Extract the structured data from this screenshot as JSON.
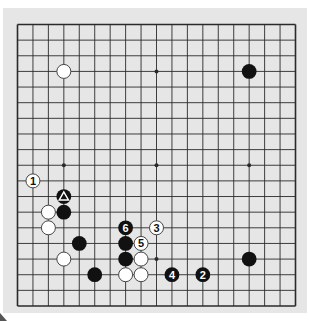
{
  "diagram": {
    "type": "go-board",
    "size": 19,
    "colors": {
      "page_bg": "#ffffff",
      "panel_bg": "#e6e6e6",
      "line": "#2a2a2a",
      "black_stone": "#111111",
      "white_stone": "#ffffff",
      "white_stone_edge": "#444444"
    },
    "star_points": [
      [
        3,
        3
      ],
      [
        9,
        3
      ],
      [
        15,
        3
      ],
      [
        3,
        9
      ],
      [
        9,
        9
      ],
      [
        15,
        9
      ],
      [
        3,
        15
      ],
      [
        9,
        15
      ],
      [
        15,
        15
      ]
    ],
    "stones": [
      {
        "col": 3,
        "row": 3,
        "color": "white",
        "label": ""
      },
      {
        "col": 15,
        "row": 3,
        "color": "black",
        "label": ""
      },
      {
        "col": 1,
        "row": 10,
        "color": "white",
        "label": "1"
      },
      {
        "col": 3,
        "row": 11,
        "color": "black",
        "label": "",
        "marker": "triangle"
      },
      {
        "col": 3,
        "row": 12,
        "color": "black",
        "label": ""
      },
      {
        "col": 2,
        "row": 12,
        "color": "white",
        "label": ""
      },
      {
        "col": 2,
        "row": 13,
        "color": "white",
        "label": ""
      },
      {
        "col": 4,
        "row": 14,
        "color": "black",
        "label": ""
      },
      {
        "col": 3,
        "row": 15,
        "color": "white",
        "label": ""
      },
      {
        "col": 5,
        "row": 16,
        "color": "black",
        "label": ""
      },
      {
        "col": 7,
        "row": 13,
        "color": "black",
        "label": "6"
      },
      {
        "col": 7,
        "row": 14,
        "color": "black",
        "label": ""
      },
      {
        "col": 7,
        "row": 15,
        "color": "black",
        "label": ""
      },
      {
        "col": 7,
        "row": 16,
        "color": "white",
        "label": ""
      },
      {
        "col": 8,
        "row": 14,
        "color": "white",
        "label": "5"
      },
      {
        "col": 8,
        "row": 15,
        "color": "white",
        "label": ""
      },
      {
        "col": 8,
        "row": 16,
        "color": "white",
        "label": ""
      },
      {
        "col": 9,
        "row": 13,
        "color": "white",
        "label": "3"
      },
      {
        "col": 10,
        "row": 16,
        "color": "black",
        "label": "4"
      },
      {
        "col": 12,
        "row": 16,
        "color": "black",
        "label": "2"
      },
      {
        "col": 15,
        "row": 15,
        "color": "black",
        "label": ""
      }
    ]
  }
}
